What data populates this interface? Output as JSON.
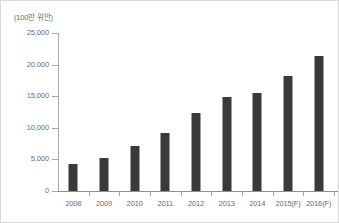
{
  "chart_data": {
    "type": "bar",
    "title": "",
    "subtitle": "",
    "unit_label": "(100만 위안)",
    "xlabel": "",
    "ylabel": "",
    "categories": [
      "2008",
      "2009",
      "2010",
      "2011",
      "2012",
      "2013",
      "2014",
      "2015(F)",
      "2016(F)"
    ],
    "values": [
      4200,
      5200,
      7100,
      9200,
      12300,
      14900,
      15500,
      18200,
      21400
    ],
    "ylim": [
      0,
      25000
    ],
    "ytick_labels": [
      "0",
      "5,000",
      "10,000",
      "15,000",
      "20,000",
      "25,000"
    ],
    "ytick_values": [
      0,
      5000,
      10000,
      15000,
      20000,
      25000
    ],
    "grid": false,
    "legend": false,
    "series": [
      {
        "name": "",
        "values": [
          4200,
          5200,
          7100,
          9200,
          12300,
          14900,
          15500,
          18200,
          21400
        ]
      }
    ],
    "colors": {
      "bar": "#3a3a3a",
      "axis": "#a8a8a8",
      "text": "#6b6b6b",
      "background": "#ffffff",
      "border": "#d9d9d9"
    }
  }
}
